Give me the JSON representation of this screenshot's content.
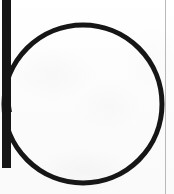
{
  "canvas": {
    "width": 174,
    "height": 194,
    "background_color": "#fdfdfd",
    "description": "Scanned black-ink glyph resembling a lowercase letter p / b: a large open circle with a straight vertical stem on its left side, on off-white paper, with a thin grey vertical rule near the right edge."
  },
  "artwork": {
    "label": "letter-glyph-p",
    "ink_color": "#161616",
    "stem": {
      "label": "vertical-stem",
      "x": 6.5,
      "top_y": 0,
      "bottom_y": 168,
      "stroke_width": 9
    },
    "bowl": {
      "label": "circle-bowl",
      "center_x": 83,
      "center_y": 104,
      "radius": 79,
      "stroke_width": 5
    }
  },
  "edge_rule": {
    "label": "right-edge-rule",
    "x": 165,
    "width": 1,
    "color": "#b9b9b9"
  }
}
